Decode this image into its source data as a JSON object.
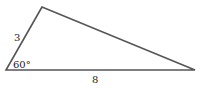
{
  "diagram": {
    "type": "triangle",
    "vertices": {
      "top": [
        42,
        7
      ],
      "bottom_left": [
        6,
        70
      ],
      "bottom_right": [
        195,
        70
      ]
    },
    "side_labels": {
      "left_side": "3",
      "bottom_side": "8"
    },
    "angle_labels": {
      "bottom_left_angle": "60°"
    },
    "stroke_color": "#555555",
    "fill_color": "#ffffff"
  }
}
